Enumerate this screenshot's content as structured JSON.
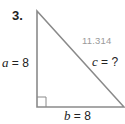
{
  "problem": {
    "number": "3.",
    "side_a": {
      "var": "a",
      "eq": " = ",
      "value": "8"
    },
    "side_b": {
      "var": "b",
      "eq": " = ",
      "value": "8"
    },
    "side_c": {
      "var": "c",
      "eq": " = ",
      "value": "?"
    },
    "handwritten_answer": "11.314"
  },
  "colors": {
    "triangle_stroke": "#8a8a8a",
    "text": "#222222",
    "answer": "#9a9a9a"
  }
}
